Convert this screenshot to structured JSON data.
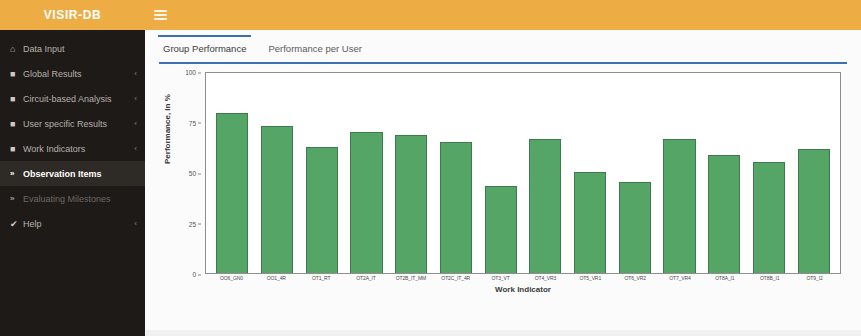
{
  "brand": {
    "title": "VISIR-DB"
  },
  "topbar": {
    "menu_icon": "hamburger-icon"
  },
  "sidebar": {
    "items": [
      {
        "label": "Data Input",
        "icon": "home-icon",
        "caret": "",
        "state": "normal"
      },
      {
        "label": "Global Results",
        "icon": "folder-icon",
        "caret": "‹",
        "state": "normal"
      },
      {
        "label": "Circuit-based Analysis",
        "icon": "folder-icon",
        "caret": "‹",
        "state": "normal"
      },
      {
        "label": "User specific Results",
        "icon": "folder-icon",
        "caret": "‹",
        "state": "normal"
      },
      {
        "label": "Work Indicators",
        "icon": "folder-icon",
        "caret": "‹",
        "state": "normal"
      },
      {
        "label": "Observation Items",
        "icon": "double-chevron-right-icon",
        "caret": "",
        "state": "active"
      },
      {
        "label": "Evaluating Milestones",
        "icon": "double-chevron-right-icon",
        "caret": "",
        "state": "dim"
      },
      {
        "label": "Help",
        "icon": "help-circle-icon",
        "caret": "‹",
        "state": "normal"
      }
    ]
  },
  "main": {
    "tabs": [
      {
        "label": "Group Performance",
        "active": true
      },
      {
        "label": "Performance per User",
        "active": false
      }
    ]
  },
  "colors": {
    "brand_orange": "#eeac44",
    "sidebar_dark": "#1e1a17",
    "accent_blue": "#3d6fb4",
    "bar_green": "#55a567",
    "bar_green_border": "#3f7a4e"
  },
  "chart_data": {
    "type": "bar",
    "title": "",
    "xlabel": "Work Indicator",
    "ylabel": "Performance, in %",
    "ylim": [
      0,
      100
    ],
    "yticks": [
      0,
      25,
      50,
      75,
      100
    ],
    "grid": false,
    "legend": "none",
    "categories": [
      "OO6_GN0",
      "OO1_4R",
      "OT1_RT",
      "OT2A_IT",
      "OT2B_IT_MM",
      "OT2C_IT_4R",
      "OT3_VT",
      "OT4_VR3",
      "OT5_VR1",
      "OT6_VR2",
      "OT7_VR4",
      "OT8A_I1",
      "OT8B_I1",
      "OT9_I2"
    ],
    "values": [
      79,
      73,
      62.5,
      70,
      68.5,
      65,
      43,
      66.5,
      50,
      45,
      66.5,
      58.5,
      55,
      61.5
    ]
  }
}
